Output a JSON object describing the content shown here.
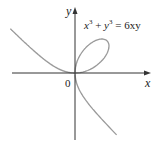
{
  "diagram": {
    "equation": {
      "lhs_x": "x",
      "lhs_x_exp": "3",
      "plus": " + ",
      "lhs_y": "y",
      "lhs_y_exp": "3",
      "rhs": " = 6xy"
    },
    "axes": {
      "x_label": "x",
      "y_label": "y",
      "origin_label": "0"
    },
    "colors": {
      "curve": "#9a9a9a",
      "axis": "#333333",
      "text": "#222222"
    }
  }
}
